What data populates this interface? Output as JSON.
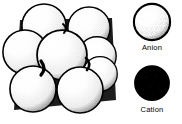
{
  "figure": {
    "background_color": "#ffffff",
    "ink_color": "#000000"
  },
  "cluster": {
    "name": "anion-close-packing-cluster",
    "sphere_count": 8,
    "sphere_style": "stippled-white-sphere-with-black-outline",
    "outline_color": "#000000",
    "fill_color": "#ffffff",
    "stipple_color": "#1a1a1a",
    "spheres": [
      {
        "id": "sphere-top-left",
        "cx": 44,
        "cy": 26,
        "r": 23,
        "layer": "back"
      },
      {
        "id": "sphere-top-right",
        "cx": 89,
        "cy": 28,
        "r": 22,
        "layer": "back"
      },
      {
        "id": "sphere-mid-left",
        "cx": 25,
        "cy": 52,
        "r": 23,
        "layer": "mid"
      },
      {
        "id": "sphere-right-upper",
        "cx": 97,
        "cy": 56,
        "r": 20,
        "layer": "mid"
      },
      {
        "id": "sphere-center",
        "cx": 62,
        "cy": 55,
        "r": 26,
        "layer": "front"
      },
      {
        "id": "sphere-bottom-left",
        "cx": 33,
        "cy": 89,
        "r": 24,
        "layer": "front"
      },
      {
        "id": "sphere-bottom-right",
        "cx": 80,
        "cy": 90,
        "r": 24,
        "layer": "front"
      },
      {
        "id": "sphere-right-lower",
        "cx": 100,
        "cy": 74,
        "r": 18,
        "layer": "mid"
      }
    ],
    "interstitial_voids": [
      {
        "id": "void-center-left",
        "cx": 41,
        "cy": 66
      },
      {
        "id": "void-center-right",
        "cx": 88,
        "cy": 64
      },
      {
        "id": "void-upper",
        "cx": 66,
        "cy": 24
      }
    ]
  },
  "legend": {
    "name": "ion-type-legend",
    "items": [
      {
        "id": "anion",
        "label": "Anion",
        "swatch": "stippled-white-sphere",
        "fill_color": "#ffffff",
        "outline_color": "#000000",
        "radius": 19
      },
      {
        "id": "cation",
        "label": "Cation",
        "swatch": "solid-black-sphere",
        "fill_color": "#000000",
        "outline_color": "#000000",
        "radius": 18
      }
    ]
  }
}
